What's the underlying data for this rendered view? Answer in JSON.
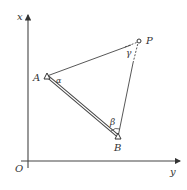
{
  "diagram": {
    "axes": {
      "vertical_label": "x",
      "horizontal_label": "y",
      "origin_label": "O"
    },
    "points": {
      "A": "A",
      "B": "B",
      "P": "P"
    },
    "angles": {
      "alpha": "α",
      "beta": "β",
      "gamma": "γ"
    }
  }
}
